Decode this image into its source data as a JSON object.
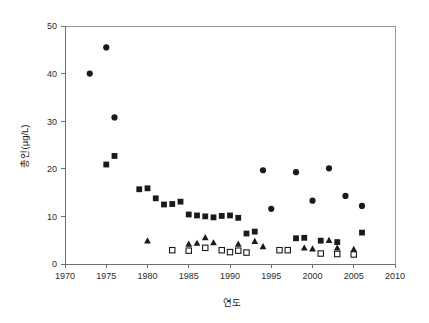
{
  "figure": {
    "background_color": "#ffffff",
    "marker_color": "#1a1a1a",
    "axis_color": "#6f6f6f",
    "frame_color": "#9a9a9a"
  },
  "chart_data": {
    "type": "scatter",
    "title": "",
    "subtitle": "",
    "xlabel": "연도",
    "ylabel": "총인(µg/L)",
    "xlim": [
      1970,
      2010
    ],
    "ylim": [
      0,
      50
    ],
    "xticks": [
      1970,
      1975,
      1980,
      1985,
      1990,
      1995,
      2000,
      2005,
      2010
    ],
    "xtick_labels": [
      "1970",
      "1975",
      "1980",
      "1985",
      "1990",
      "1995",
      "2000",
      "2005",
      "2010"
    ],
    "yticks": [
      0,
      10,
      20,
      30,
      40,
      50
    ],
    "ytick_labels": [
      "0",
      "10",
      "20",
      "30",
      "40",
      "50"
    ],
    "grid": false,
    "legend": "none",
    "series": [
      {
        "name": "filled-circle",
        "marker": "circle",
        "filled": true,
        "color": "#1a1a1a",
        "points": [
          [
            1973,
            40.0
          ],
          [
            1975,
            45.5
          ],
          [
            1976,
            30.8
          ],
          [
            1994,
            19.7
          ],
          [
            1995,
            11.6
          ],
          [
            1998,
            19.3
          ],
          [
            2000,
            13.3
          ],
          [
            2002,
            20.1
          ],
          [
            2004,
            14.3
          ],
          [
            2006,
            12.2
          ]
        ]
      },
      {
        "name": "filled-square",
        "marker": "square",
        "filled": true,
        "color": "#1a1a1a",
        "points": [
          [
            1975,
            20.9
          ],
          [
            1976,
            22.7
          ],
          [
            1979,
            15.7
          ],
          [
            1980,
            15.9
          ],
          [
            1981,
            13.8
          ],
          [
            1982,
            12.5
          ],
          [
            1983,
            12.6
          ],
          [
            1984,
            13.1
          ],
          [
            1985,
            10.4
          ],
          [
            1986,
            10.2
          ],
          [
            1987,
            10.0
          ],
          [
            1988,
            9.8
          ],
          [
            1989,
            10.1
          ],
          [
            1990,
            10.2
          ],
          [
            1991,
            9.7
          ],
          [
            1992,
            6.4
          ],
          [
            1993,
            6.8
          ],
          [
            1998,
            5.4
          ],
          [
            1999,
            5.5
          ],
          [
            2001,
            4.9
          ],
          [
            2003,
            4.6
          ],
          [
            2006,
            6.6
          ]
        ]
      },
      {
        "name": "filled-triangle",
        "marker": "triangle",
        "filled": true,
        "color": "#1a1a1a",
        "points": [
          [
            1980,
            4.9
          ],
          [
            1985,
            4.2
          ],
          [
            1986,
            4.4
          ],
          [
            1987,
            5.6
          ],
          [
            1988,
            4.5
          ],
          [
            1991,
            4.2
          ],
          [
            1993,
            4.8
          ],
          [
            1994,
            3.7
          ],
          [
            1999,
            3.4
          ],
          [
            2000,
            3.2
          ],
          [
            2002,
            5.0
          ],
          [
            2003,
            3.4
          ],
          [
            2005,
            3.1
          ]
        ]
      },
      {
        "name": "open-square",
        "marker": "square",
        "filled": false,
        "color": "#1a1a1a",
        "points": [
          [
            1983,
            2.9
          ],
          [
            1985,
            2.8
          ],
          [
            1987,
            3.4
          ],
          [
            1989,
            2.9
          ],
          [
            1990,
            2.5
          ],
          [
            1991,
            2.8
          ],
          [
            1992,
            2.4
          ],
          [
            1996,
            2.9
          ],
          [
            1997,
            2.9
          ],
          [
            2001,
            2.2
          ],
          [
            2003,
            2.1
          ],
          [
            2005,
            2.0
          ]
        ]
      }
    ]
  }
}
